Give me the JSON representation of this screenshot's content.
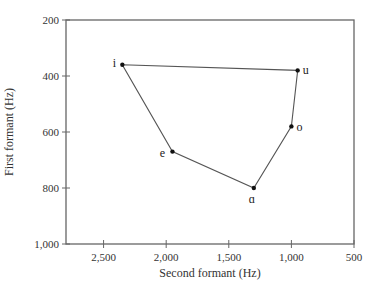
{
  "chart_data": {
    "type": "scatter",
    "title": "",
    "xlabel": "Second formant (Hz)",
    "ylabel": "First formant (Hz)",
    "xlim": [
      2800,
      500
    ],
    "ylim": [
      1000,
      200
    ],
    "x_reversed": true,
    "y_reversed": true,
    "x_ticks": [
      2500,
      2000,
      1500,
      1000,
      500
    ],
    "x_tick_labels": [
      "2,500",
      "2,000",
      "1,500",
      "1,000",
      "500"
    ],
    "y_ticks": [
      200,
      400,
      600,
      800,
      1000
    ],
    "y_tick_labels": [
      "200",
      "400",
      "600",
      "800",
      "1,000"
    ],
    "grid": false,
    "legend": null,
    "connected": true,
    "closed_path": true,
    "points": [
      {
        "label": "i",
        "f2": 2350,
        "f1": 360
      },
      {
        "label": "u",
        "f2": 950,
        "f1": 380
      },
      {
        "label": "o",
        "f2": 1000,
        "f1": 580
      },
      {
        "label": "ɑ",
        "f2": 1300,
        "f1": 800
      },
      {
        "label": "e",
        "f2": 1950,
        "f1": 670
      }
    ],
    "colors": {
      "axis": "#666666",
      "line": "#555555",
      "marker": "#111111"
    }
  }
}
